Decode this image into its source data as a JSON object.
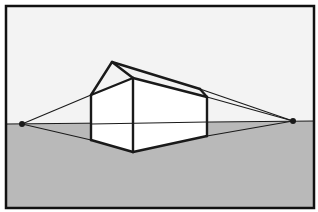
{
  "diagram": {
    "type": "two-point-perspective",
    "colors": {
      "sky": "#f3f3f3",
      "ground": "#b9b9b9",
      "frame": "#111111",
      "lines": "#1a1a1a",
      "walls": "#ffffff"
    },
    "frame": {
      "x": 6,
      "y": 6,
      "w": 308,
      "h": 202
    },
    "horizon": {
      "left": [
        6,
        124
      ],
      "right": [
        314,
        121
      ]
    },
    "vanishing_points": {
      "left": [
        22,
        124
      ],
      "right": [
        293,
        121
      ]
    },
    "house": {
      "front_top": [
        133,
        78
      ],
      "front_bottom": [
        133,
        152
      ],
      "left_top": [
        91,
        95
      ],
      "left_bottom": [
        91,
        140
      ],
      "right_top": [
        207,
        97
      ],
      "right_bottom": [
        207,
        136
      ],
      "roof_peak": [
        112,
        62
      ],
      "roof_right": [
        200,
        89
      ]
    }
  }
}
